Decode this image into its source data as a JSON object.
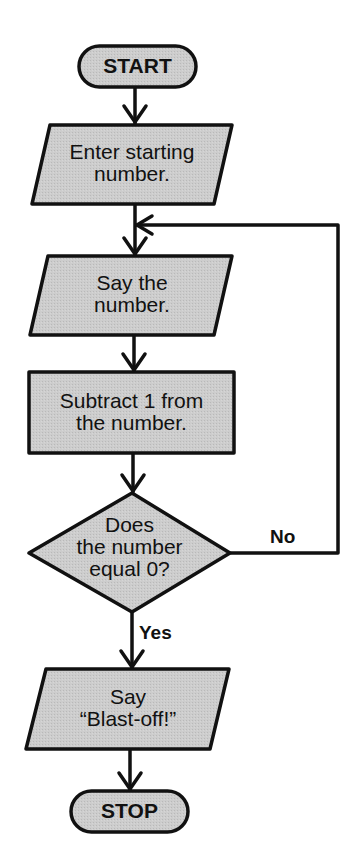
{
  "diagram": {
    "type": "flowchart",
    "colors": {
      "fill": "#c9c9c9",
      "stroke": "#111111",
      "background": "#ffffff"
    },
    "nodes": [
      {
        "id": "start",
        "shape": "terminal",
        "lines": [
          "START"
        ]
      },
      {
        "id": "enter",
        "shape": "parallelogram",
        "lines": [
          "Enter starting",
          "number."
        ]
      },
      {
        "id": "say",
        "shape": "parallelogram",
        "lines": [
          "Say the",
          "number."
        ]
      },
      {
        "id": "subtract",
        "shape": "rectangle",
        "lines": [
          "Subtract 1 from",
          "the number."
        ]
      },
      {
        "id": "decision",
        "shape": "diamond",
        "lines": [
          "Does",
          "the number",
          "equal 0?"
        ]
      },
      {
        "id": "blastoff",
        "shape": "parallelogram",
        "lines": [
          "Say",
          "“Blast-off!”"
        ]
      },
      {
        "id": "stop",
        "shape": "terminal",
        "lines": [
          "STOP"
        ]
      }
    ],
    "edges": [
      {
        "from": "start",
        "to": "enter",
        "label": ""
      },
      {
        "from": "enter",
        "to": "say",
        "label": ""
      },
      {
        "from": "say",
        "to": "subtract",
        "label": ""
      },
      {
        "from": "subtract",
        "to": "decision",
        "label": ""
      },
      {
        "from": "decision",
        "to": "say",
        "label": "No"
      },
      {
        "from": "decision",
        "to": "blastoff",
        "label": "Yes"
      },
      {
        "from": "blastoff",
        "to": "stop",
        "label": ""
      }
    ],
    "branch_labels": {
      "no": "No",
      "yes": "Yes"
    }
  }
}
